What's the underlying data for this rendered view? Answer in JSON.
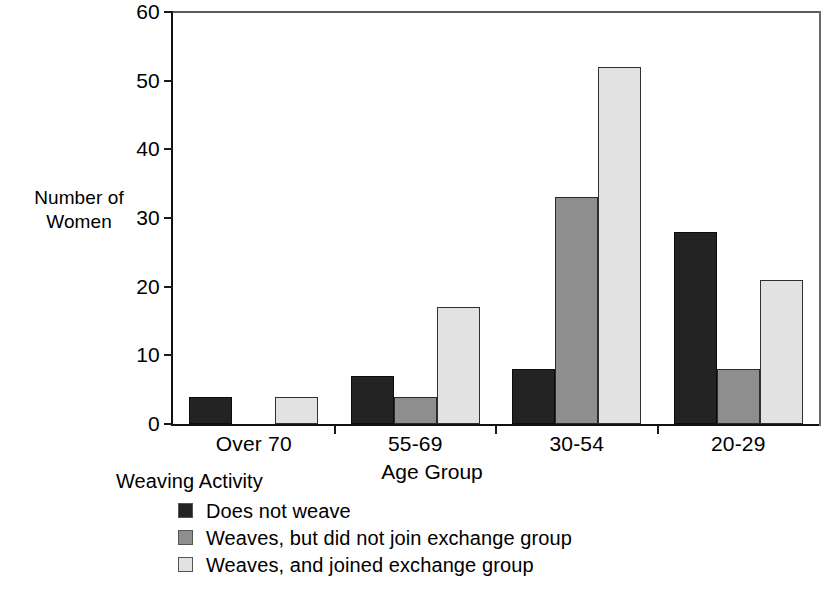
{
  "chart_data": {
    "type": "bar",
    "title": "",
    "xlabel": "Age Group",
    "ylabel": "Number of\nWomen",
    "ylabel_line1": "Number of",
    "ylabel_line2": "Women",
    "categories": [
      "Over 70",
      "55-69",
      "30-54",
      "20-29"
    ],
    "series": [
      {
        "name": "Does not weave",
        "color": "#232323",
        "values": [
          4,
          7,
          8,
          28
        ]
      },
      {
        "name": "Weaves, but did not join exchange group",
        "color": "#8e8e8e",
        "values": [
          0,
          4,
          33,
          8
        ]
      },
      {
        "name": "Weaves, and joined exchange group",
        "color": "#e2e2e2",
        "values": [
          4,
          17,
          52,
          21
        ]
      }
    ],
    "ylim": [
      0,
      60
    ],
    "yticks": [
      0,
      10,
      20,
      30,
      40,
      50,
      60
    ],
    "ytick_labels": [
      "0",
      "10",
      "20",
      "30",
      "40",
      "50",
      "60"
    ],
    "grid": false,
    "legend_position": "below-left",
    "legend_title": "Weaving Activity"
  },
  "axes": {
    "y_title_line1": "Number of",
    "y_title_line2": "Women",
    "x_title": "Age Group"
  },
  "legend": {
    "title": "Weaving Activity",
    "items": [
      {
        "label": "Does not weave"
      },
      {
        "label": "Weaves, but did not join exchange group"
      },
      {
        "label": "Weaves, and joined exchange group"
      }
    ]
  }
}
